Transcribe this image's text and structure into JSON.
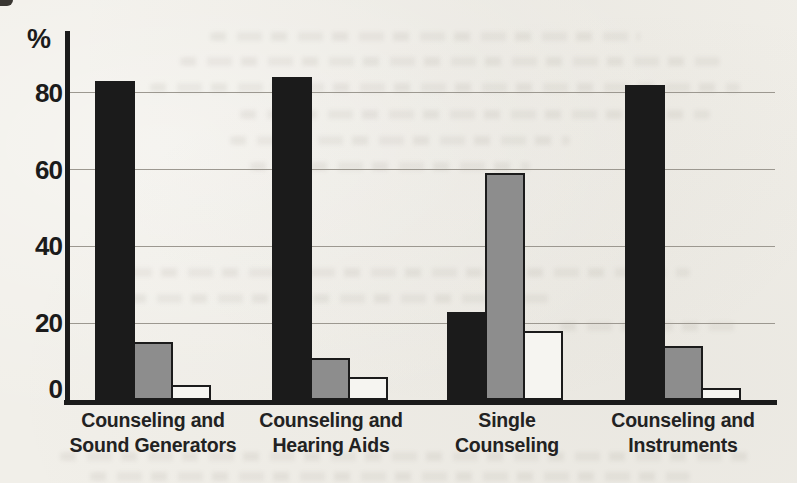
{
  "figure": {
    "background_color": "#f1efe9",
    "axis_color": "#1b1b1b",
    "gridline_color": "#9c9890"
  },
  "chart_data": {
    "type": "bar",
    "title": "",
    "xlabel": "",
    "ylabel": "%",
    "ylim": [
      0,
      100
    ],
    "yticks": [
      0,
      20,
      40,
      60,
      80
    ],
    "grid": true,
    "legend_position": "none",
    "categories": [
      "Counseling and Sound Generators",
      "Counseling and Hearing Aids",
      "Single Counseling",
      "Counseling and Instruments"
    ],
    "category_lines": [
      [
        "Counseling and",
        "Sound Generators"
      ],
      [
        "Counseling and",
        "Hearing Aids"
      ],
      [
        "Single",
        "Counseling"
      ],
      [
        "Counseling and",
        "Instruments"
      ]
    ],
    "series": [
      {
        "name": "black",
        "color": "#1b1b1b",
        "values": [
          83,
          84,
          23,
          82
        ]
      },
      {
        "name": "gray",
        "color": "#8d8d8d",
        "values": [
          15,
          11,
          59,
          14
        ]
      },
      {
        "name": "white",
        "color": "#f6f5f1",
        "values": [
          4,
          6,
          18,
          3
        ]
      }
    ]
  }
}
